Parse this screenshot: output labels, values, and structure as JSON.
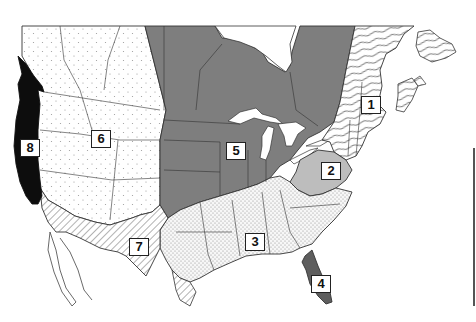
{
  "map": {
    "title": "",
    "subject": "North America regional divisions map",
    "colors": {
      "background": "#ffffff",
      "region_1_northeast": "#ffffff",
      "region_2_mid_atlantic": "#b9b9b9",
      "region_3_southeast": "#f2f2f2",
      "region_4_florida": "#5e5e5e",
      "region_5_midwest_central_canada": "#7c7c7c",
      "region_6_mountain_west": "#ffffff",
      "region_7_southwest": "#f6f6f6",
      "region_8_pacific_coast": "#0d0d0d",
      "border": "#333333"
    },
    "patterns": {
      "region_1": "wavy-lines",
      "region_2": "solid-light-gray",
      "region_3": "fine-dots",
      "region_4": "solid-dark-gray",
      "region_5": "solid-medium-gray",
      "region_6": "sparse-dots",
      "region_7": "diagonal-hatch",
      "region_8": "solid-black"
    },
    "labels": [
      {
        "id": "1",
        "text": "1",
        "x": 361,
        "y": 96
      },
      {
        "id": "2",
        "text": "2",
        "x": 321,
        "y": 162
      },
      {
        "id": "3",
        "text": "3",
        "x": 245,
        "y": 233
      },
      {
        "id": "4",
        "text": "4",
        "x": 311,
        "y": 275
      },
      {
        "id": "5",
        "text": "5",
        "x": 226,
        "y": 142
      },
      {
        "id": "6",
        "text": "6",
        "x": 91,
        "y": 130
      },
      {
        "id": "7",
        "text": "7",
        "x": 129,
        "y": 238
      },
      {
        "id": "8",
        "text": "8",
        "x": 20,
        "y": 139
      }
    ]
  }
}
